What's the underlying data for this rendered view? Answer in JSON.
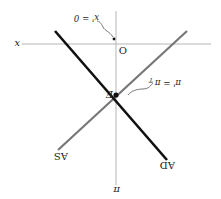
{
  "diagram": {
    "orientation": "rotated 180 degrees",
    "axes": {
      "vertical_label": "π",
      "horizontal_label": "x",
      "origin_label": "O"
    },
    "curves": [
      {
        "name": "AD",
        "label": "AD",
        "color": "#111111"
      },
      {
        "name": "AS",
        "label": "AS",
        "color": "#777777"
      }
    ],
    "points": {
      "equilibrium_label": "E",
      "equilibrium_annotation": "π' = π",
      "equilibrium_annotation_sub": "T",
      "origin_annotation": "x' = 0"
    }
  }
}
